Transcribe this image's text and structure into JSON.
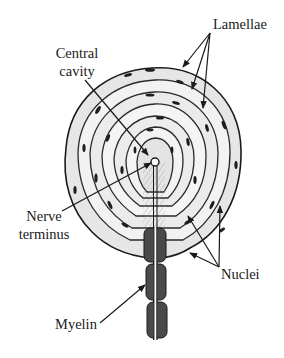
{
  "figure": {
    "labels": {
      "lamellae": "Lamellae",
      "central_cavity_line1": "Central",
      "central_cavity_line2": "cavity",
      "nerve_terminus_line1": "Nerve",
      "nerve_terminus_line2": "terminus",
      "nuclei": "Nuclei",
      "myelin": "Myelin"
    },
    "colors": {
      "ink": "#1a1a1a",
      "shading": "#d9d9d9",
      "myelin_fill": "#4a4a4a",
      "background": "#ffffff"
    }
  }
}
